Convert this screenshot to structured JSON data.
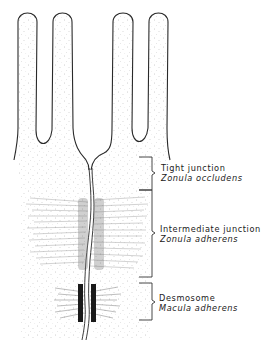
{
  "figure": {
    "structures": {
      "microvilli_count": 4
    },
    "labels": [
      {
        "id": "tight",
        "name": "Tight junction",
        "latin": "Zonula occludens"
      },
      {
        "id": "intermediate",
        "name": "Intermediate junction",
        "latin": "Zonula adherens"
      },
      {
        "id": "desmosome",
        "name": "Desmosome",
        "latin": "Macula adherens"
      }
    ],
    "colors": {
      "ink": "#2a2a2a",
      "background": "#ffffff",
      "stipple": "#9a9a9a"
    }
  }
}
